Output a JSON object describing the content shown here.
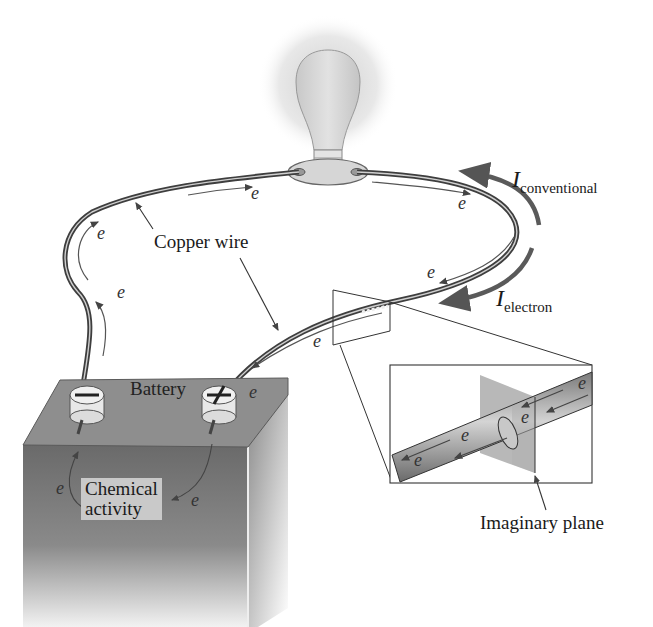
{
  "figure": {
    "labels": {
      "copper_wire": "Copper wire",
      "battery": "Battery",
      "chemical_activity_line1": "Chemical",
      "chemical_activity_line2": "activity",
      "imaginary_plane": "Imaginary plane",
      "i_conventional_symbol": "I",
      "i_conventional_sub": "conventional",
      "i_electron_symbol": "I",
      "i_electron_sub": "electron"
    },
    "electron_symbol": "e",
    "terminals": {
      "negative": "−",
      "positive": "+"
    },
    "components": [
      "light-bulb",
      "lamp-socket",
      "copper-wire",
      "battery",
      "magnified-wire-inset",
      "imaginary-plane"
    ],
    "colors": {
      "background": "#ffffff",
      "wire": "#4a4a4a",
      "battery_top": "#8c8c8c",
      "battery_front": "#6e6e6e",
      "battery_side": "#9a9a9a",
      "chemical_box": "#c9c9c9",
      "plane": "#b8b8b8",
      "bulb": "#d8d8d8",
      "glow": "#e6e6e6",
      "arrow": "#555555"
    }
  }
}
